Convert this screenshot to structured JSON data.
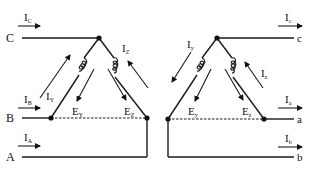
{
  "diagram": {
    "left_side": {
      "terminals": [
        {
          "name": "C",
          "current": "I",
          "current_sub": "C"
        },
        {
          "name": "B",
          "current": "I",
          "current_sub": "B"
        },
        {
          "name": "A",
          "current": "I",
          "current_sub": "A"
        }
      ],
      "winding_currents": [
        {
          "label": "I",
          "sub": "Y"
        },
        {
          "label": "I",
          "sub": "Z"
        }
      ],
      "emfs": [
        {
          "label": "E",
          "sub": "Y"
        },
        {
          "label": "E",
          "sub": "Z"
        }
      ]
    },
    "right_side": {
      "terminals": [
        {
          "name": "c",
          "current": "I",
          "current_sub": "c"
        },
        {
          "name": "a",
          "current": "I",
          "current_sub": "a"
        },
        {
          "name": "b",
          "current": "I",
          "current_sub": "b"
        }
      ],
      "winding_currents": [
        {
          "label": "I",
          "sub": "y"
        },
        {
          "label": "I",
          "sub": "z"
        }
      ],
      "emfs": [
        {
          "label": "E",
          "sub": "y"
        },
        {
          "label": "E",
          "sub": "z"
        }
      ]
    }
  }
}
